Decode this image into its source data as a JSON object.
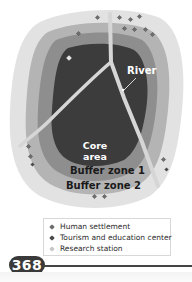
{
  "diagram": {
    "labels": {
      "river": "River",
      "core_line1": "Core",
      "core_line2": "area",
      "buffer_zone_1": "Buffer zone 1",
      "buffer_zone_2": "Buffer zone 2"
    },
    "zone_colors": {
      "outer_transition": "#e2e2e2",
      "buffer_zone_2": "#b4b4b4",
      "buffer_zone_1": "#8e8e8e",
      "core_area": "#3c3c3c",
      "river": "#d6d6d6"
    },
    "markers": {
      "human_settlement_count": 14,
      "tourism_center_count": 3,
      "research_station_count": 1
    }
  },
  "legend": {
    "items": [
      {
        "label": "Human settlement",
        "icon": "settlement-marker-icon",
        "color": "#6e6e6e"
      },
      {
        "label": "Tourism and education center",
        "icon": "tourism-marker-icon",
        "color": "#4a4a4a"
      },
      {
        "label": "Research station",
        "icon": "research-marker-icon",
        "color": "#c8c8c8"
      }
    ]
  },
  "page": {
    "number": "368"
  }
}
